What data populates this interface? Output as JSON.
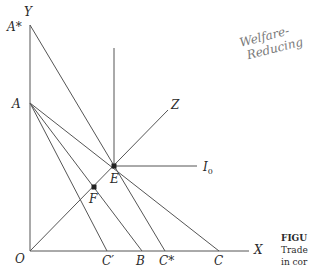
{
  "diagram": {
    "axes": {
      "y_label": "Y",
      "x_label": "X",
      "origin_label": "O"
    },
    "y_intercepts": {
      "a_star": "A*",
      "a": "A"
    },
    "x_intercepts": {
      "c_prime": "C′",
      "b": "B",
      "c_star": "C*",
      "c": "C"
    },
    "points": {
      "e": "E",
      "f": "F"
    },
    "curves": {
      "z": "Z",
      "i0": "I",
      "i0_sub": "0"
    },
    "annotation": {
      "line1": "Welfare-",
      "line2": "Reducing"
    },
    "caption": {
      "title": "FIGU",
      "line1": "Trade",
      "line2": "in cor"
    }
  }
}
